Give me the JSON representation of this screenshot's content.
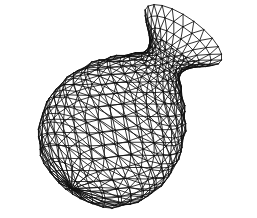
{
  "figure": {
    "caption": "",
    "background_color": "#ffffff",
    "line_color": "#111111",
    "line_width": 0.85
  },
  "mesh": {
    "rings": 24,
    "segments": 22,
    "triangulated": true,
    "profile": [
      {
        "s": 0.0,
        "r": 0.0
      },
      {
        "s": 0.03,
        "r": 30
      },
      {
        "s": 0.1,
        "r": 52
      },
      {
        "s": 0.2,
        "r": 66
      },
      {
        "s": 0.32,
        "r": 72
      },
      {
        "s": 0.44,
        "r": 70
      },
      {
        "s": 0.56,
        "r": 61
      },
      {
        "s": 0.66,
        "r": 47
      },
      {
        "s": 0.74,
        "r": 32
      },
      {
        "s": 0.8,
        "r": 22
      },
      {
        "s": 0.85,
        "r": 20
      },
      {
        "s": 0.9,
        "r": 27
      },
      {
        "s": 0.95,
        "r": 38
      },
      {
        "s": 1.0,
        "r": 46
      }
    ],
    "axis_length": 205,
    "view": {
      "yaw_deg": -58,
      "pitch_deg": 22,
      "roll_deg": -36,
      "center_x": 123,
      "center_y": 118,
      "axis_offset": -0.46
    }
  }
}
